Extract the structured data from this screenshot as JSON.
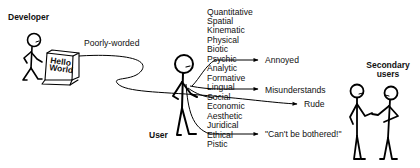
{
  "labels": {
    "developer": "Developer",
    "user": "User",
    "secondary_line1": "Secondary",
    "secondary_line2": "users",
    "poorly_worded": "Poorly-worded",
    "screen_line1": "Hello",
    "screen_line2": "World"
  },
  "aspects": [
    "Quantitative",
    "Spatial",
    "Kinematic",
    "Physical",
    "Biotic",
    "Psychic",
    "Analytic",
    "Formative",
    "Lingual",
    "Social",
    "Economic",
    "Aesthetic",
    "Juridical",
    "Ethical",
    "Pistic"
  ],
  "outcomes": {
    "annoyed": "Annoyed",
    "misunderstands": "Misunderstands",
    "rude": "Rude",
    "cant_be_bothered": "\"Can't be bothered!\""
  },
  "colors": {
    "ink": "#000000",
    "background": "#ffffff"
  }
}
